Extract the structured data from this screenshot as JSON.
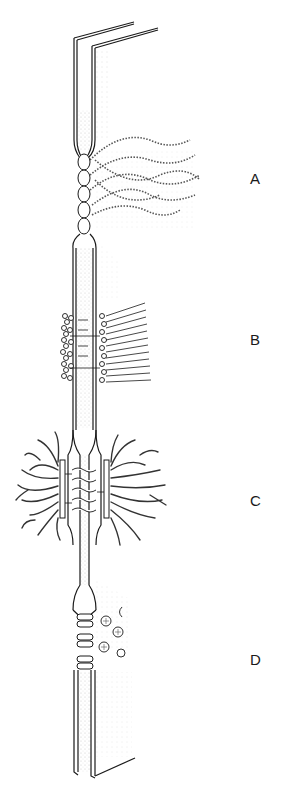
{
  "figure": {
    "labels": [
      {
        "id": "A",
        "text": "A"
      },
      {
        "id": "B",
        "text": "B"
      },
      {
        "id": "C",
        "text": "C"
      },
      {
        "id": "D",
        "text": "D"
      }
    ],
    "colors": {
      "ink": "#1a1a1a",
      "stipple": "#8a8a8a",
      "paper": "#ffffff"
    }
  }
}
